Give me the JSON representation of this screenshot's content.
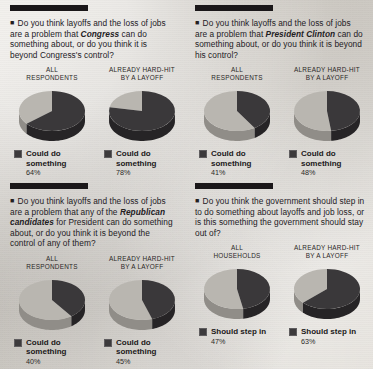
{
  "chart_data": [
    {
      "type": "pie",
      "title": "Do you think layoffs and the loss of jobs are a problem that Congress can do something about, or do you think it is beyond Congress's control?",
      "emphasis": "Congress",
      "legend_label": "Could do something",
      "groups": [
        {
          "name": "ALL RESPONDENTS",
          "value": 64,
          "unit": "%",
          "label": "64%"
        },
        {
          "name": "ALREADY HARD-HIT BY A LAYOFF",
          "value": 78,
          "unit": "%",
          "label": "78%"
        }
      ]
    },
    {
      "type": "pie",
      "title": "Do you think layoffs and the loss of jobs are a problem that President Clinton can do something about, or do you think it is beyond his control?",
      "emphasis": "President Clinton",
      "legend_label": "Could do something",
      "groups": [
        {
          "name": "ALL RESPONDENTS",
          "value": 41,
          "unit": "%",
          "label": "41%"
        },
        {
          "name": "ALREADY HARD-HIT BY A LAYOFF",
          "value": 48,
          "unit": "%",
          "label": "48%"
        }
      ]
    },
    {
      "type": "pie",
      "title": "Do you think layoffs and the loss of jobs are a problem that any of the Republican candidates for President can do something about, or do you think it is beyond the control of any of them?",
      "emphasis": "Republican candidates",
      "legend_label": "Could do something",
      "groups": [
        {
          "name": "ALL RESPONDENTS",
          "value": 40,
          "unit": "%",
          "label": "40%"
        },
        {
          "name": "ALREADY HARD-HIT BY A LAYOFF",
          "value": 45,
          "unit": "%",
          "label": "45%"
        }
      ]
    },
    {
      "type": "pie",
      "title": "Do you think the government should step in to do something about layoffs and job loss, or is this something the government should stay out of?",
      "emphasis": "",
      "legend_label": "Should step in",
      "groups": [
        {
          "name": "ALL HOUSEHOLDS",
          "value": 47,
          "unit": "%",
          "label": "47%"
        },
        {
          "name": "ALREADY HARD-HIT BY A LAYOFF",
          "value": 63,
          "unit": "%",
          "label": "63%"
        }
      ]
    }
  ],
  "panels": [
    {
      "bullet": "■",
      "question_pre": "Do you think layoffs and the loss of jobs are a problem that ",
      "question_em": "Congress",
      "question_post": " can do something about, or do you think it is beyond Congress's control?",
      "legend_label": "Could do something",
      "groups": [
        {
          "header_line1": "ALL",
          "header_line2": "RESPONDENTS",
          "pct": "64%"
        },
        {
          "header_line1": "ALREADY HARD-HIT",
          "header_line2": "BY A LAYOFF",
          "pct": "78%"
        }
      ]
    },
    {
      "bullet": "■",
      "question_pre": "Do you think layoffs and the loss of jobs are a problem that ",
      "question_em": "President Clinton",
      "question_post": " can do something about, or do you think it is beyond his control?",
      "legend_label": "Could do something",
      "groups": [
        {
          "header_line1": "ALL",
          "header_line2": "RESPONDENTS",
          "pct": "41%"
        },
        {
          "header_line1": "ALREADY HARD-HIT",
          "header_line2": "BY A LAYOFF",
          "pct": "48%"
        }
      ]
    },
    {
      "bullet": "■",
      "question_pre": "Do you think layoffs and the loss of jobs are a problem that any of the ",
      "question_em": "Republican candidates",
      "question_post": " for President can do something about, or do you think it is beyond the control of any of them?",
      "legend_label": "Could do something",
      "groups": [
        {
          "header_line1": "ALL",
          "header_line2": "RESPONDENTS",
          "pct": "40%"
        },
        {
          "header_line1": "ALREADY HARD-HIT",
          "header_line2": "BY A LAYOFF",
          "pct": "45%"
        }
      ]
    },
    {
      "bullet": "■",
      "question_pre": "Do you think the government should step in to do something about layoffs and job loss, or is this something the government should stay out of?",
      "question_em": "",
      "question_post": "",
      "legend_label": "Should step in",
      "groups": [
        {
          "header_line1": "ALL",
          "header_line2": "HOUSEHOLDS",
          "pct": "47%"
        },
        {
          "header_line1": "ALREADY HARD-HIT",
          "header_line2": "BY A LAYOFF",
          "pct": "63%"
        }
      ]
    }
  ],
  "colors": {
    "wedge_dark": "#3a383a",
    "wedge_light": "#b9b6b0",
    "wedge_dark_side": "#262426",
    "wedge_light_side": "#908d88",
    "rule": "#1a1719",
    "paper": "#ddd9d2"
  }
}
